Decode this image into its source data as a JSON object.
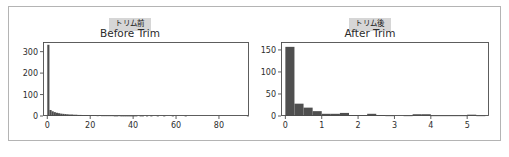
{
  "figure": {
    "background_color": "#ffffff",
    "frame_color": "#b4b4b4",
    "bar_color": "#4f4f4f",
    "badge_background": "#d6d6d6"
  },
  "panels": [
    {
      "badge": "トリム前",
      "title": "Before Trim"
    },
    {
      "badge": "トリム後",
      "title": "After Trim"
    }
  ],
  "chart_data": [
    {
      "type": "bar",
      "title": "Before Trim",
      "subtitle": "トリム前",
      "xlabel": "",
      "ylabel": "",
      "xlim": [
        -2,
        94
      ],
      "ylim": [
        0,
        345
      ],
      "xticks": [
        0,
        20,
        40,
        60,
        80
      ],
      "xtick_labels": [
        "0",
        "20",
        "40",
        "60",
        "80"
      ],
      "yticks": [
        0,
        100,
        200,
        300
      ],
      "ytick_labels": [
        "0",
        "100",
        "200",
        "300"
      ],
      "grid": false,
      "legend": "none",
      "bin_width": 1,
      "bin_starts": [
        0,
        1,
        2,
        3,
        4,
        5,
        6,
        7,
        8,
        9,
        10,
        11,
        12,
        13,
        14,
        15,
        16,
        17,
        18,
        19,
        20,
        21,
        22,
        23,
        24,
        25,
        26,
        27,
        28,
        29,
        30,
        31,
        32,
        33,
        34,
        35,
        36,
        37,
        38,
        39,
        40,
        41,
        42,
        43,
        44,
        45,
        46,
        47,
        48,
        49,
        50,
        51,
        52,
        53,
        54,
        55,
        56,
        57,
        58,
        59,
        60,
        61,
        62,
        63,
        64,
        65,
        66,
        67,
        68,
        69,
        70,
        71,
        72,
        73,
        74,
        75,
        76,
        77,
        78,
        79,
        80,
        81,
        82,
        83,
        84,
        85,
        86,
        87,
        88,
        89,
        90,
        91,
        92,
        93
      ],
      "values": [
        332,
        28,
        22,
        18,
        15,
        13,
        11,
        10,
        9,
        8,
        7,
        7,
        6,
        6,
        5,
        5,
        4,
        4,
        4,
        3,
        3,
        3,
        3,
        2,
        3,
        2,
        2,
        2,
        2,
        2,
        2,
        1,
        1,
        2,
        1,
        1,
        1,
        1,
        1,
        1,
        1,
        1,
        0,
        1,
        1,
        0,
        1,
        0,
        1,
        0,
        0,
        1,
        0,
        0,
        1,
        0,
        0,
        0,
        1,
        0,
        0,
        0,
        0,
        0,
        1,
        0,
        0,
        0,
        0,
        0,
        0,
        0,
        0,
        0,
        0,
        0,
        0,
        0,
        0,
        0,
        0,
        0,
        0,
        0,
        0,
        0,
        0,
        0,
        0,
        0,
        0,
        0,
        0,
        1
      ]
    },
    {
      "type": "bar",
      "title": "After Trim",
      "subtitle": "トリム後",
      "xlabel": "",
      "ylabel": "",
      "xlim": [
        -0.12,
        5.6
      ],
      "ylim": [
        0,
        168
      ],
      "xticks": [
        0,
        1,
        2,
        3,
        4,
        5
      ],
      "xtick_labels": [
        "0",
        "1",
        "2",
        "3",
        "4",
        "5"
      ],
      "yticks": [
        0,
        50,
        100,
        150
      ],
      "ytick_labels": [
        "0",
        "50",
        "100",
        "150"
      ],
      "grid": false,
      "legend": "none",
      "bin_width": 0.25,
      "bin_starts": [
        0.0,
        0.25,
        0.5,
        0.75,
        1.0,
        1.25,
        1.5,
        1.75,
        2.0,
        2.25,
        2.5,
        2.75,
        3.0,
        3.25,
        3.5,
        3.75,
        4.0,
        4.25,
        4.5,
        4.75,
        5.0,
        5.25
      ],
      "values": [
        157,
        28,
        19,
        11,
        5,
        5,
        7,
        2,
        2,
        5,
        2,
        1,
        0,
        1,
        4,
        4,
        1,
        1,
        1,
        1,
        3,
        1
      ]
    }
  ]
}
